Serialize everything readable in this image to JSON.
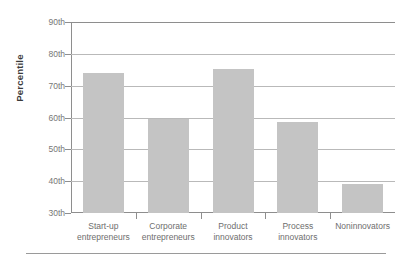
{
  "chart_data": {
    "type": "bar",
    "title": "",
    "subtitle": "",
    "xlabel": "",
    "ylabel": "Percentile",
    "categories": [
      "Start-up entrepreneurs",
      "Corporate entrepreneurs",
      "Product innovators",
      "Process innovators",
      "Noninnovators"
    ],
    "category_lines": [
      [
        "Start-up",
        "entrepreneurs"
      ],
      [
        "Corporate",
        "entrepreneurs"
      ],
      [
        "Product",
        "innovators"
      ],
      [
        "Process",
        "innovators"
      ],
      [
        "Noninnovators"
      ]
    ],
    "values": [
      74,
      59.6,
      75.3,
      58.5,
      39
    ],
    "ylim": [
      30,
      90
    ],
    "ytick_values": [
      30,
      40,
      50,
      60,
      70,
      80,
      90
    ],
    "ytick_labels": [
      "30th",
      "40th",
      "50th",
      "60th",
      "70th",
      "80th",
      "90th"
    ],
    "grid": true,
    "grid_axis": "y",
    "legend": "none",
    "bar_color": "#c4c4c4",
    "axis_color": "#8e8e8e",
    "grid_color": "#b9b9b9",
    "text_color": "#6e6e6e"
  }
}
